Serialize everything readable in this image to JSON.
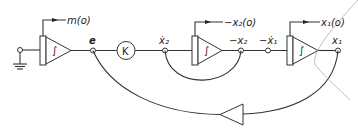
{
  "diagram": {
    "type": "analog-computer block diagram",
    "initial_conditions": {
      "int1": "m(o)",
      "int2": "−x₂(o)",
      "int3": "x₁(o)"
    },
    "integrator_symbol": "∫",
    "gain_block": "K",
    "nodes": {
      "e": "e",
      "x2dot": "ẋ₂",
      "neg_x2": "−x₂",
      "neg_x1dot": "−ẋ₁",
      "x1": "x₁"
    },
    "colors": {
      "line": "#333333",
      "background": "#ffffff",
      "pencil_mark": "#b8b8b8"
    }
  }
}
